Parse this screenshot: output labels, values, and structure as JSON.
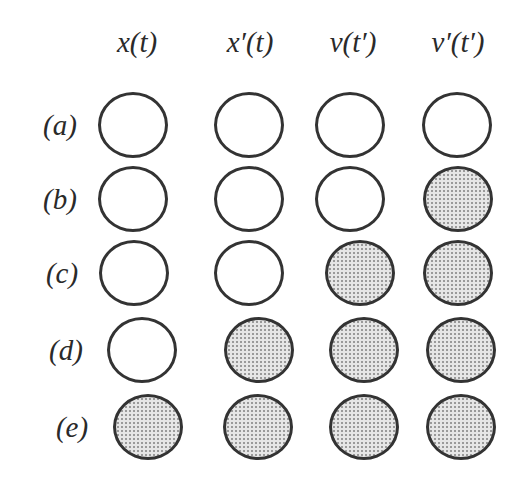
{
  "columns": [
    {
      "label": "x(t)",
      "cx": 137
    },
    {
      "label": "x′(t)",
      "cx": 250
    },
    {
      "label": "v(t′)",
      "cx": 353
    },
    {
      "label": "v′(t′)",
      "cx": 458
    }
  ],
  "rows": [
    {
      "label": "(a)",
      "cy": 125,
      "filled": [
        false,
        false,
        false,
        false
      ],
      "cx": [
        133,
        249,
        350,
        457
      ]
    },
    {
      "label": "(b)",
      "cy": 199,
      "filled": [
        false,
        false,
        false,
        true
      ],
      "cx": [
        133,
        249,
        350,
        458
      ]
    },
    {
      "label": "(c)",
      "cy": 273,
      "filled": [
        false,
        false,
        true,
        true
      ],
      "cx": [
        134,
        249,
        360,
        458
      ]
    },
    {
      "label": "(d)",
      "cy": 350,
      "filled": [
        false,
        true,
        true,
        true
      ],
      "cx": [
        142,
        259,
        364,
        461
      ]
    },
    {
      "label": "(e)",
      "cy": 427,
      "filled": [
        true,
        true,
        true,
        true
      ],
      "cx": [
        148,
        258,
        364,
        461
      ]
    }
  ],
  "row_label_x": [
    60,
    60,
    62,
    66,
    72
  ],
  "circle": {
    "w": 70,
    "h": 66
  },
  "colors": {
    "stroke": "#333333",
    "fill": "#e6e6e6",
    "dot": "#9a9a9a"
  }
}
